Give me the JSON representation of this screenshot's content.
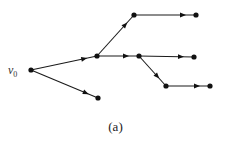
{
  "diagram": {
    "type": "directed-tree",
    "caption": "(a)",
    "root_label": "v",
    "root_subscript": "0",
    "colors": {
      "edge": "#1a1a1a",
      "node": "#111111",
      "background": "#ffffff"
    },
    "nodes": [
      {
        "id": "v0",
        "x": 31,
        "y": 70,
        "label": "v0"
      },
      {
        "id": "n1",
        "x": 97,
        "y": 56
      },
      {
        "id": "n2",
        "x": 134,
        "y": 15
      },
      {
        "id": "n3",
        "x": 196,
        "y": 15
      },
      {
        "id": "n4",
        "x": 139,
        "y": 56
      },
      {
        "id": "n5",
        "x": 194,
        "y": 57
      },
      {
        "id": "n6",
        "x": 166,
        "y": 86
      },
      {
        "id": "n7",
        "x": 210,
        "y": 86
      },
      {
        "id": "n8",
        "x": 98,
        "y": 98
      }
    ],
    "edges": [
      {
        "from": "v0",
        "to": "n1"
      },
      {
        "from": "v0",
        "to": "n8"
      },
      {
        "from": "n1",
        "to": "n2"
      },
      {
        "from": "n1",
        "to": "n4"
      },
      {
        "from": "n2",
        "to": "n3"
      },
      {
        "from": "n4",
        "to": "n5"
      },
      {
        "from": "n4",
        "to": "n6"
      },
      {
        "from": "n6",
        "to": "n7"
      }
    ]
  }
}
